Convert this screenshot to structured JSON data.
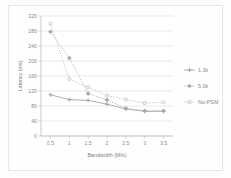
{
  "chart_data": {
    "type": "line",
    "title": "",
    "xlabel": "Bandwidth (M/s)",
    "ylabel": "Latency (ms)",
    "xlim": [
      0.25,
      3.75
    ],
    "ylim": [
      0,
      320
    ],
    "x": [
      0.5,
      1,
      1.5,
      2,
      2.5,
      3,
      3.5
    ],
    "xticks": [
      "0.5",
      "1",
      "1.5",
      "2",
      "2.5",
      "3",
      "3.5"
    ],
    "yticks": [
      "0",
      "40",
      "80",
      "120",
      "160",
      "200",
      "240",
      "280",
      "320"
    ],
    "ytick_values": [
      0,
      40,
      80,
      120,
      160,
      200,
      240,
      280,
      320
    ],
    "grid": true,
    "legend_position": "right",
    "series": [
      {
        "name": "1.3k",
        "color": "#9a9a9a",
        "marker": "cross",
        "linestyle": "solid",
        "values": [
          110,
          97,
          95,
          85,
          72,
          66,
          66
        ]
      },
      {
        "name": "5.0k",
        "color": "#a8a8a8",
        "marker": "diamond",
        "linestyle": "dotted",
        "values": [
          278,
          208,
          113,
          96,
          74,
          67,
          67
        ]
      },
      {
        "name": "No-PSM",
        "color": "#bdbdbd",
        "marker": "circle",
        "linestyle": "dotted",
        "values": [
          300,
          152,
          130,
          108,
          97,
          88,
          90
        ]
      }
    ]
  },
  "legend": {
    "items": [
      {
        "label": "1.3k"
      },
      {
        "label": "5.0k"
      },
      {
        "label": "No-PSM"
      }
    ]
  },
  "axes": {
    "x_title": "Bandwidth (M/s)",
    "y_title": "Latency (ms)"
  }
}
